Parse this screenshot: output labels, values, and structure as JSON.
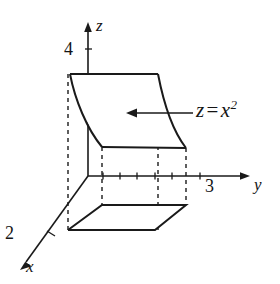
{
  "figure": {
    "type": "3d-coordinate-sketch",
    "ink_color": "#1a1a1a",
    "background_color": "#ffffff",
    "axes": [
      {
        "id": "z",
        "label": "z",
        "direction": "up",
        "arrow": true
      },
      {
        "id": "y",
        "label": "y",
        "direction": "right",
        "arrow": true
      },
      {
        "id": "x",
        "label": "x",
        "direction": "down-left",
        "arrow": true
      }
    ],
    "tick_labels": [
      {
        "id": "z-tick-4",
        "axis": "z",
        "value": "4"
      },
      {
        "id": "y-tick-3",
        "axis": "y",
        "value": "3"
      },
      {
        "id": "x-tick-2",
        "axis": "x",
        "value": "2"
      }
    ],
    "annotation": {
      "id": "surface-equation",
      "lhs": "z",
      "operator": "=",
      "base": "x",
      "exponent": "2",
      "full_text": "z = x²",
      "pointer": "arrow-left"
    },
    "shapes": [
      {
        "id": "parabolic-surface",
        "kind": "curved-sheet",
        "description": "surface z = x^2 rising from base"
      },
      {
        "id": "base-rectangle",
        "kind": "parallelogram",
        "description": "rectangular region in the xy-plane"
      }
    ]
  }
}
